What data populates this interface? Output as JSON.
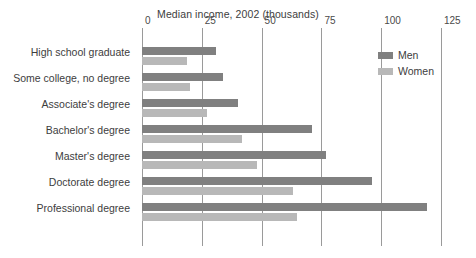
{
  "chart_data": {
    "type": "bar",
    "orientation": "horizontal",
    "title": "Median income, 2002 (thousands)",
    "xlabel": "",
    "ylabel": "",
    "xlim": [
      0,
      125
    ],
    "xticks": [
      0,
      25,
      50,
      75,
      100,
      125
    ],
    "xtick_labels": [
      "0",
      "25",
      "50",
      "75",
      "100",
      "125"
    ],
    "grid": "vertical",
    "legend_position": "top-right-inside",
    "categories": [
      "High school graduate",
      "Some college, no degree",
      "Associate's degree",
      "Bachelor's degree",
      "Master's degree",
      "Doctorate degree",
      "Professional degree"
    ],
    "series": [
      {
        "name": "Men",
        "color": "#808080",
        "values": [
          31,
          34,
          40,
          71,
          77,
          96,
          119
        ]
      },
      {
        "name": "Women",
        "color": "#b8b8b8",
        "values": [
          19,
          20,
          27,
          42,
          48,
          63,
          65
        ]
      }
    ]
  }
}
